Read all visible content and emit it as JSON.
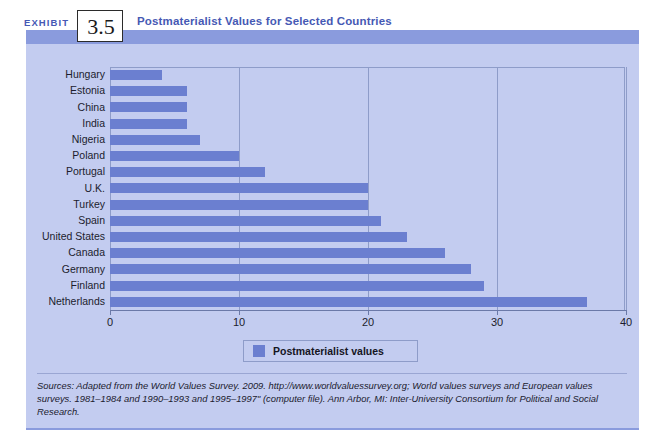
{
  "exhibit": {
    "label": "EXHIBIT",
    "number": "3.5",
    "title": "Postmaterialist Values for Selected Countries"
  },
  "legend": {
    "series_label": "Postmaterialist values",
    "swatch_color": "#6b7fd0"
  },
  "source_note": "Sources: Adapted from the World Values Survey. 2009. http://www.worldvaluessurvey.org; World values surveys and European values surveys. 1981–1984 and 1990–1993 and 1995–1997\" (computer file). Ann Arbor, MI: Inter-University Consortium for Political and Social Research.",
  "chart_data": {
    "type": "bar",
    "orientation": "horizontal",
    "title": "Postmaterialist Values for Selected Countries",
    "xlabel": "",
    "ylabel": "",
    "xlim": [
      0,
      40
    ],
    "xticks": [
      0,
      10,
      20,
      30,
      40
    ],
    "xtick_labels": [
      "0",
      "10",
      "20",
      "30",
      "40"
    ],
    "grid": true,
    "grid_axis": "x",
    "legend_position": "bottom-center",
    "series": [
      {
        "name": "Postmaterialist values",
        "color": "#6b7fd0",
        "values": [
          4,
          6,
          6,
          6,
          7,
          10,
          12,
          20,
          20,
          21,
          23,
          26,
          28,
          29,
          37
        ]
      }
    ],
    "categories": [
      "Hungary",
      "Estonia",
      "China",
      "India",
      "Nigeria",
      "Poland",
      "Portugal",
      "U.K.",
      "Turkey",
      "Spain",
      "United States",
      "Canada",
      "Germany",
      "Finland",
      "Netherlands"
    ]
  }
}
